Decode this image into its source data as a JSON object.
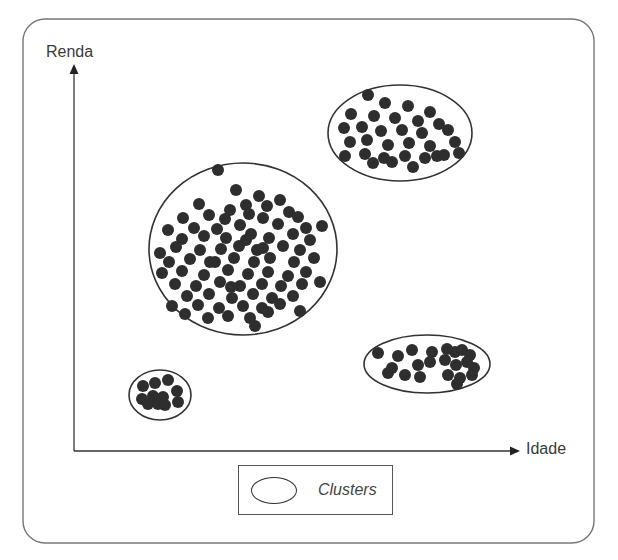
{
  "figure": {
    "y_axis_label": "Renda",
    "x_axis_label": "Idade",
    "legend": {
      "label": "Clusters",
      "symbol": "ellipse"
    }
  },
  "colors": {
    "frame": "#777777",
    "axis": "#333333",
    "point": "#2e2e2e",
    "ellipse": "#333333",
    "text": "#3a3a3a"
  },
  "clusters": [
    {
      "name": "cluster-large-center",
      "ellipse": {
        "cx": 243,
        "cy": 249,
        "rx": 94,
        "ry": 86
      },
      "points": [
        [
          218,
          170
        ],
        [
          236,
          190
        ],
        [
          259,
          196
        ],
        [
          280,
          200
        ],
        [
          199,
          204
        ],
        [
          246,
          205
        ],
        [
          267,
          206
        ],
        [
          230,
          210
        ],
        [
          289,
          212
        ],
        [
          183,
          218
        ],
        [
          209,
          215
        ],
        [
          225,
          219
        ],
        [
          249,
          214
        ],
        [
          263,
          218
        ],
        [
          298,
          217
        ],
        [
          168,
          230
        ],
        [
          194,
          228
        ],
        [
          217,
          229
        ],
        [
          240,
          225
        ],
        [
          278,
          224
        ],
        [
          306,
          228
        ],
        [
          322,
          226
        ],
        [
          182,
          239
        ],
        [
          204,
          236
        ],
        [
          226,
          238
        ],
        [
          251,
          234
        ],
        [
          269,
          238
        ],
        [
          293,
          234
        ],
        [
          310,
          240
        ],
        [
          160,
          253
        ],
        [
          176,
          247
        ],
        [
          200,
          250
        ],
        [
          221,
          249
        ],
        [
          239,
          246
        ],
        [
          257,
          250
        ],
        [
          283,
          246
        ],
        [
          300,
          250
        ],
        [
          169,
          262
        ],
        [
          190,
          259
        ],
        [
          210,
          262
        ],
        [
          234,
          258
        ],
        [
          254,
          262
        ],
        [
          270,
          258
        ],
        [
          294,
          262
        ],
        [
          314,
          258
        ],
        [
          162,
          273
        ],
        [
          182,
          271
        ],
        [
          204,
          275
        ],
        [
          228,
          270
        ],
        [
          248,
          274
        ],
        [
          268,
          272
        ],
        [
          288,
          276
        ],
        [
          306,
          272
        ],
        [
          175,
          284
        ],
        [
          196,
          286
        ],
        [
          220,
          282
        ],
        [
          240,
          286
        ],
        [
          262,
          284
        ],
        [
          281,
          286
        ],
        [
          302,
          284
        ],
        [
          320,
          282
        ],
        [
          187,
          296
        ],
        [
          209,
          294
        ],
        [
          232,
          298
        ],
        [
          253,
          294
        ],
        [
          272,
          298
        ],
        [
          293,
          296
        ],
        [
          172,
          306
        ],
        [
          198,
          305
        ],
        [
          219,
          308
        ],
        [
          243,
          306
        ],
        [
          262,
          308
        ],
        [
          280,
          304
        ],
        [
          185,
          314
        ],
        [
          208,
          318
        ],
        [
          228,
          316
        ],
        [
          250,
          318
        ],
        [
          268,
          312
        ],
        [
          300,
          311
        ],
        [
          255,
          326
        ],
        [
          231,
          287
        ],
        [
          246,
          240
        ],
        [
          215,
          262
        ],
        [
          263,
          248
        ]
      ]
    },
    {
      "name": "cluster-upper-right",
      "ellipse": {
        "cx": 400,
        "cy": 133,
        "rx": 72,
        "ry": 48
      },
      "points": [
        [
          368,
          95
        ],
        [
          385,
          103
        ],
        [
          408,
          106
        ],
        [
          430,
          112
        ],
        [
          351,
          114
        ],
        [
          374,
          116
        ],
        [
          395,
          118
        ],
        [
          418,
          121
        ],
        [
          439,
          124
        ],
        [
          344,
          128
        ],
        [
          362,
          127
        ],
        [
          381,
          131
        ],
        [
          402,
          130
        ],
        [
          422,
          133
        ],
        [
          448,
          130
        ],
        [
          350,
          142
        ],
        [
          367,
          140
        ],
        [
          388,
          145
        ],
        [
          409,
          143
        ],
        [
          430,
          146
        ],
        [
          455,
          142
        ],
        [
          345,
          156
        ],
        [
          365,
          154
        ],
        [
          384,
          158
        ],
        [
          405,
          156
        ],
        [
          425,
          158
        ],
        [
          444,
          155
        ],
        [
          373,
          163
        ],
        [
          392,
          162
        ],
        [
          413,
          167
        ],
        [
          437,
          156
        ],
        [
          459,
          153
        ]
      ]
    },
    {
      "name": "cluster-lower-right",
      "ellipse": {
        "cx": 427,
        "cy": 364,
        "rx": 63,
        "ry": 29
      },
      "points": [
        [
          378,
          353
        ],
        [
          398,
          356
        ],
        [
          412,
          350
        ],
        [
          432,
          352
        ],
        [
          447,
          349
        ],
        [
          455,
          352
        ],
        [
          462,
          350
        ],
        [
          470,
          355
        ],
        [
          392,
          368
        ],
        [
          405,
          375
        ],
        [
          418,
          365
        ],
        [
          430,
          362
        ],
        [
          445,
          360
        ],
        [
          456,
          365
        ],
        [
          467,
          362
        ],
        [
          474,
          368
        ],
        [
          388,
          373
        ],
        [
          420,
          377
        ],
        [
          448,
          375
        ],
        [
          460,
          378
        ],
        [
          472,
          375
        ],
        [
          457,
          384
        ]
      ]
    },
    {
      "name": "cluster-small-lower-left",
      "ellipse": {
        "cx": 160,
        "cy": 395,
        "rx": 31,
        "ry": 25
      },
      "points": [
        [
          143,
          386
        ],
        [
          155,
          383
        ],
        [
          168,
          380
        ],
        [
          177,
          391
        ],
        [
          142,
          399
        ],
        [
          153,
          396
        ],
        [
          163,
          397
        ],
        [
          148,
          404
        ],
        [
          158,
          404
        ],
        [
          165,
          405
        ],
        [
          178,
          402
        ]
      ]
    }
  ],
  "layout": {
    "frame": {
      "x": 23,
      "y": 19,
      "w": 571,
      "h": 524,
      "r": 22
    },
    "origin": {
      "x": 74,
      "y": 451
    },
    "y_axis_top": 64,
    "x_axis_right": 520,
    "point_radius": 6
  }
}
